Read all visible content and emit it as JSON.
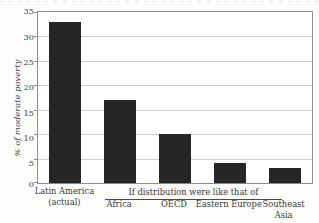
{
  "chart_data": {
    "type": "bar",
    "title": "",
    "xlabel": "",
    "ylabel": "% of moderate poverty",
    "ylim": [
      0,
      35
    ],
    "yticks": [
      0,
      5,
      10,
      15,
      20,
      25,
      30,
      35
    ],
    "grid": true,
    "legend": null,
    "categories": [
      "Latin America\n(actual)",
      "Africa",
      "OECD",
      "Eastern Europe",
      "Southeast Asia"
    ],
    "values": [
      33,
      17,
      10,
      4,
      3
    ],
    "bar_color": "#262626",
    "annotations": [
      {
        "text": "If distribution were like that of",
        "spans_categories": [
          "Africa",
          "OECD",
          "Eastern Europe",
          "Southeast Asia"
        ]
      }
    ]
  },
  "axis": {
    "y_title": "% of moderate poverty",
    "tick_labels": [
      "35",
      "30",
      "25",
      "20",
      "15",
      "10",
      "5",
      "0"
    ]
  },
  "categories": [
    {
      "line1": "Latin America",
      "line2": "(actual)"
    },
    {
      "line1": "Africa",
      "line2": ""
    },
    {
      "line1": "OECD",
      "line2": ""
    },
    {
      "line1": "Eastern Europe",
      "line2": ""
    },
    {
      "line1": "Southeast",
      "line2": "Asia"
    }
  ],
  "group_caption": "If distribution were like that of",
  "colors": {
    "bar": "#262626",
    "frame": "#8c8c8c",
    "gridline": "#cfcfcf",
    "text": "#3a3a3a"
  }
}
